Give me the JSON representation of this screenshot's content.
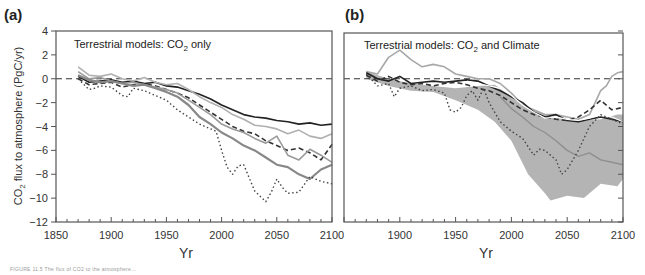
{
  "figure": {
    "caption_partial": "FIGURE 11.5 The flux of CO2 to the atmosphere..."
  },
  "chart_data": [
    {
      "id": "a",
      "type": "line",
      "panel_label": "(a)",
      "annotation": "Terrestrial models: CO2 only",
      "annotation_main": "Terrestrial models: CO",
      "annotation_sub": "2",
      "annotation_tail": " only",
      "xlabel": "Yr",
      "ylabel": "CO2 flux to atmosphere (PgC/yr)",
      "ylabel_prefix": "CO",
      "ylabel_sub": "2",
      "ylabel_tail": " flux to atmosphere (PgC/yr)",
      "xlim": [
        1850,
        2100
      ],
      "ylim": [
        -12,
        4
      ],
      "xticks": [
        1850,
        1900,
        1950,
        2000,
        2050,
        2100
      ],
      "yticks": [
        4,
        2,
        0,
        -2,
        -4,
        -6,
        -8,
        -10,
        -12
      ],
      "reference_line": {
        "y": 0,
        "style": "dashed"
      },
      "grid": false,
      "series": [
        {
          "name": "model-1 (black solid)",
          "color": "#222222",
          "style": "solid",
          "width": 1.6,
          "x": [
            1870,
            1880,
            1890,
            1900,
            1910,
            1920,
            1930,
            1940,
            1950,
            1960,
            1970,
            1980,
            1990,
            2000,
            2010,
            2020,
            2030,
            2040,
            2050,
            2060,
            2070,
            2080,
            2090,
            2100
          ],
          "y": [
            0.2,
            -0.3,
            -0.2,
            -0.1,
            -0.3,
            -0.2,
            -0.4,
            -0.3,
            -0.6,
            -0.7,
            -1.0,
            -1.3,
            -1.7,
            -2.2,
            -2.6,
            -3.0,
            -3.2,
            -3.3,
            -3.5,
            -3.6,
            -3.8,
            -3.7,
            -3.9,
            -3.8
          ]
        },
        {
          "name": "model-2 (dark dashed)",
          "color": "#333333",
          "style": "dashed",
          "width": 1.6,
          "x": [
            1870,
            1880,
            1890,
            1900,
            1910,
            1920,
            1930,
            1940,
            1950,
            1960,
            1970,
            1980,
            1990,
            2000,
            2010,
            2020,
            2030,
            2040,
            2050,
            2060,
            2070,
            2080,
            2090,
            2100
          ],
          "y": [
            0.0,
            -0.5,
            -0.4,
            -0.3,
            -0.7,
            -0.5,
            -0.4,
            -0.6,
            -0.9,
            -1.2,
            -1.6,
            -2.2,
            -2.8,
            -3.4,
            -4.0,
            -4.4,
            -4.6,
            -5.2,
            -5.6,
            -6.0,
            -5.8,
            -6.2,
            -6.8,
            -5.5
          ]
        },
        {
          "name": "model-3 (light gray)",
          "color": "#b0b0b0",
          "style": "solid",
          "width": 1.6,
          "x": [
            1870,
            1880,
            1890,
            1900,
            1910,
            1920,
            1930,
            1940,
            1950,
            1960,
            1970,
            1980,
            1990,
            2000,
            2010,
            2020,
            2030,
            2040,
            2050,
            2060,
            2070,
            2080,
            2090,
            2100
          ],
          "y": [
            1.0,
            0.3,
            0.2,
            0.4,
            0.0,
            -0.2,
            0.1,
            -0.3,
            -0.5,
            -0.4,
            -0.9,
            -1.5,
            -2.0,
            -2.4,
            -3.0,
            -3.4,
            -3.9,
            -4.0,
            -4.2,
            -4.6,
            -4.3,
            -4.8,
            -5.0,
            -4.6
          ]
        },
        {
          "name": "model-4 (mid gray)",
          "color": "#9a9a9a",
          "style": "solid",
          "width": 1.6,
          "x": [
            1870,
            1880,
            1890,
            1900,
            1910,
            1920,
            1930,
            1940,
            1950,
            1960,
            1970,
            1980,
            1990,
            2000,
            2010,
            2020,
            2030,
            2040,
            2050,
            2060,
            2070,
            2080,
            2090,
            2100
          ],
          "y": [
            0.6,
            0.0,
            0.1,
            -0.2,
            -0.4,
            -0.3,
            -0.5,
            -0.7,
            -0.9,
            -1.2,
            -1.8,
            -2.4,
            -3.0,
            -3.8,
            -4.2,
            -4.5,
            -5.0,
            -5.4,
            -4.8,
            -6.4,
            -6.8,
            -5.9,
            -6.4,
            -7.0
          ]
        },
        {
          "name": "model-5 (gray thick)",
          "color": "#888888",
          "style": "solid",
          "width": 2.2,
          "x": [
            1870,
            1880,
            1890,
            1900,
            1910,
            1920,
            1930,
            1940,
            1950,
            1960,
            1970,
            1980,
            1990,
            2000,
            2010,
            2020,
            2030,
            2040,
            2050,
            2060,
            2070,
            2080,
            2090,
            2100
          ],
          "y": [
            0.3,
            -0.1,
            -0.3,
            -0.2,
            -0.4,
            -0.6,
            -0.5,
            -0.8,
            -1.1,
            -1.5,
            -2.2,
            -3.2,
            -3.8,
            -4.5,
            -5.0,
            -5.6,
            -6.0,
            -6.6,
            -7.2,
            -7.4,
            -8.0,
            -8.4,
            -7.6,
            -7.2
          ]
        },
        {
          "name": "model-6 (dotted)",
          "color": "#444444",
          "style": "dotted",
          "width": 1.4,
          "x": [
            1870,
            1880,
            1885,
            1890,
            1900,
            1910,
            1915,
            1920,
            1930,
            1940,
            1950,
            1960,
            1970,
            1980,
            1990,
            1995,
            2000,
            2005,
            2010,
            2015,
            2020,
            2030,
            2040,
            2045,
            2050,
            2055,
            2060,
            2070,
            2080,
            2090,
            2100
          ],
          "y": [
            0.0,
            -0.9,
            -0.8,
            -0.6,
            -0.7,
            -1.4,
            -1.5,
            -0.8,
            -1.0,
            -1.4,
            -1.8,
            -2.6,
            -3.2,
            -3.8,
            -4.2,
            -4.4,
            -6.0,
            -7.4,
            -8.0,
            -7.3,
            -7.2,
            -9.4,
            -10.3,
            -9.5,
            -8.4,
            -9.1,
            -9.6,
            -9.5,
            -8.2,
            -8.6,
            -8.8
          ]
        }
      ]
    },
    {
      "id": "b",
      "type": "line",
      "panel_label": "(b)",
      "annotation": "Terrestrial models: CO2 and Climate",
      "annotation_main": "Terrestrial models: CO",
      "annotation_sub": "2",
      "annotation_tail": " and Climate",
      "xlabel": "Yr",
      "xlim": [
        1850,
        2100
      ],
      "ylim": [
        -12,
        4
      ],
      "xticks": [
        1900,
        1950,
        2000,
        2050,
        2100
      ],
      "xtick_labels": [
        "1900",
        "1950",
        "2000",
        "2050",
        "2100"
      ],
      "yticks_right": [
        4,
        2,
        0,
        -2,
        -4,
        -6,
        -8,
        -10,
        -12
      ],
      "reference_line": {
        "y": 0,
        "style": "dashed"
      },
      "grid": false,
      "shaded_band": {
        "name": "model-spread band",
        "color": "#b4b4b4",
        "x": [
          1870,
          1890,
          1910,
          1930,
          1950,
          1970,
          1985,
          2000,
          2015,
          2030,
          2035,
          2050,
          2065,
          2080,
          2095,
          2100
        ],
        "upper": [
          0.6,
          0.0,
          -0.4,
          -0.6,
          -0.8,
          -0.6,
          -0.5,
          -1.4,
          -2.4,
          -3.0,
          -3.2,
          -3.4,
          -3.5,
          -3.4,
          -3.0,
          -3.0
        ],
        "lower": [
          0.0,
          -0.6,
          -1.0,
          -1.1,
          -1.8,
          -2.6,
          -3.6,
          -5.2,
          -8.0,
          -9.6,
          -10.2,
          -9.8,
          -10.0,
          -8.8,
          -9.0,
          -8.4
        ]
      },
      "series": [
        {
          "name": "model-1 (light gray high)",
          "color": "#a8a8a8",
          "style": "solid",
          "width": 1.6,
          "x": [
            1870,
            1880,
            1890,
            1900,
            1910,
            1920,
            1930,
            1940,
            1950,
            1960,
            1970,
            1980,
            1990,
            2000,
            2010,
            2020,
            2030,
            2040,
            2050,
            2060,
            2070,
            2080,
            2085,
            2090,
            2095,
            2100
          ],
          "y": [
            0.6,
            0.4,
            1.8,
            2.4,
            1.6,
            1.0,
            1.2,
            1.0,
            0.4,
            0.2,
            0.0,
            0.0,
            -0.4,
            -1.2,
            -2.2,
            -2.6,
            -3.0,
            -3.0,
            -3.2,
            -3.4,
            -3.0,
            -1.0,
            -0.6,
            0.2,
            0.5,
            0.6
          ]
        },
        {
          "name": "model-2 (black solid)",
          "color": "#222222",
          "style": "solid",
          "width": 1.6,
          "x": [
            1870,
            1880,
            1890,
            1900,
            1910,
            1920,
            1930,
            1940,
            1950,
            1960,
            1970,
            1980,
            1990,
            2000,
            2010,
            2020,
            2030,
            2040,
            2050,
            2060,
            2070,
            2080,
            2090,
            2100
          ],
          "y": [
            0.5,
            0.0,
            -0.2,
            0.2,
            -0.4,
            -0.3,
            -0.2,
            -0.3,
            -0.2,
            -0.1,
            -0.2,
            -0.6,
            -1.0,
            -1.5,
            -2.0,
            -2.8,
            -3.2,
            -3.0,
            -3.5,
            -3.6,
            -3.4,
            -3.2,
            -3.4,
            -3.6
          ]
        },
        {
          "name": "model-3 (dark dashed)",
          "color": "#333333",
          "style": "dashed",
          "width": 1.6,
          "x": [
            1870,
            1880,
            1890,
            1900,
            1910,
            1920,
            1930,
            1940,
            1950,
            1960,
            1970,
            1980,
            1990,
            2000,
            2010,
            2020,
            2030,
            2040,
            2050,
            2060,
            2070,
            2080,
            2090,
            2100
          ],
          "y": [
            0.3,
            -0.2,
            0.2,
            -0.3,
            -0.5,
            -0.4,
            -0.6,
            -0.4,
            -0.3,
            -0.5,
            -0.8,
            -1.0,
            -1.4,
            -2.0,
            -2.6,
            -3.0,
            -3.2,
            -3.4,
            -3.5,
            -3.2,
            -2.6,
            -1.8,
            -2.6,
            -2.4
          ]
        },
        {
          "name": "model-4 (white outline)",
          "color": "#ffffff",
          "style": "solid",
          "width": 1.2,
          "x": [
            1960,
            1970,
            1980,
            1990,
            2000,
            2010,
            2020,
            2030,
            2040,
            2050,
            2060,
            2070,
            2080,
            2090,
            2100
          ],
          "y": [
            -0.2,
            -0.4,
            -0.6,
            -0.8,
            -1.4,
            -2.2,
            -2.8,
            -3.3,
            -3.2,
            -3.4,
            -3.5,
            -3.3,
            -3.0,
            -3.2,
            -3.6
          ]
        },
        {
          "name": "model-5 (gray inside band)",
          "color": "#8f8f8f",
          "style": "solid",
          "width": 1.4,
          "x": [
            1990,
            2000,
            2010,
            2020,
            2030,
            2040,
            2050,
            2060,
            2070,
            2080,
            2090,
            2100
          ],
          "y": [
            -1.5,
            -2.5,
            -3.2,
            -4.0,
            -4.5,
            -5.2,
            -6.0,
            -6.5,
            -6.2,
            -6.8,
            -7.0,
            -7.2
          ]
        },
        {
          "name": "model-6 (dotted)",
          "color": "#444444",
          "style": "dotted",
          "width": 1.4,
          "x": [
            1870,
            1880,
            1890,
            1895,
            1900,
            1910,
            1920,
            1930,
            1940,
            1945,
            1950,
            1955,
            1960,
            1965,
            1970,
            1975,
            1980,
            1990,
            2000,
            2010,
            2020,
            2025,
            2030,
            2040,
            2045,
            2050,
            2060,
            2070,
            2080,
            2090,
            2100
          ],
          "y": [
            0.4,
            -0.6,
            -0.4,
            -1.5,
            -0.8,
            -0.6,
            -1.0,
            -0.9,
            -1.2,
            -2.6,
            -2.8,
            -2.4,
            -1.4,
            -1.0,
            -1.8,
            -0.8,
            -2.0,
            -3.6,
            -4.4,
            -5.0,
            -6.4,
            -5.9,
            -6.0,
            -6.8,
            -8.0,
            -7.6,
            -6.0,
            -4.0,
            -3.0,
            -3.4,
            -3.8
          ]
        }
      ]
    }
  ]
}
